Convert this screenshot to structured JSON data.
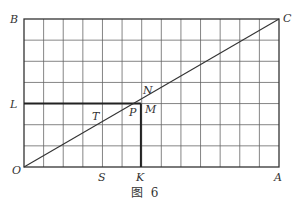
{
  "figure": {
    "caption": "图  6",
    "grid": {
      "columns": 13,
      "rows": 7,
      "left": 24,
      "top": 19,
      "right": 279,
      "bottom": 167
    },
    "points": {
      "O": "O",
      "A": "A",
      "B": "B",
      "C": "C",
      "L": "L",
      "K": "K",
      "S": "S",
      "T": "T",
      "P": "P",
      "M": "M",
      "N": "N"
    },
    "segments": [
      "OC",
      "LP",
      "PK"
    ],
    "colors": {
      "line": "#333333",
      "grid": "#555555"
    }
  }
}
